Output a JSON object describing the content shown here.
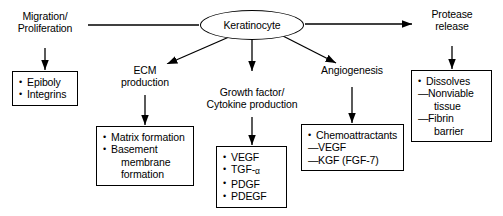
{
  "diagram": {
    "type": "flow-diagram",
    "stroke_color": "#000000",
    "background_color": "#ffffff",
    "center": {
      "label": "Keratinocyte",
      "shape": "ellipse"
    },
    "branches": [
      {
        "id": "migration",
        "label_lines": [
          "Migration/",
          "Proliferation"
        ],
        "arrow_from_center": "left",
        "box": {
          "items": [
            {
              "marker": "bullet",
              "text": "Epiboly"
            },
            {
              "marker": "bullet",
              "text": "Integrins"
            }
          ]
        }
      },
      {
        "id": "ecm",
        "label_lines": [
          "ECM",
          "production"
        ],
        "arrow_from_center": "diagonal-down-left",
        "box": {
          "items": [
            {
              "marker": "bullet",
              "text": "Matrix formation"
            },
            {
              "marker": "bullet",
              "text": "Basement"
            },
            {
              "marker": "cont",
              "text": "membrane"
            },
            {
              "marker": "cont",
              "text": "formation"
            }
          ]
        }
      },
      {
        "id": "growth-factor",
        "label_lines": [
          "Growth factor/",
          "Cytokine production"
        ],
        "arrow_from_center": "down",
        "box": {
          "items": [
            {
              "marker": "bullet",
              "text": "VEGF"
            },
            {
              "marker": "bullet",
              "text": "TGF-",
              "sub": "α"
            },
            {
              "marker": "bullet",
              "text": "PDGF"
            },
            {
              "marker": "bullet",
              "text": "PDEGF"
            }
          ]
        }
      },
      {
        "id": "angiogenesis",
        "label_lines": [
          "Angiogenesis"
        ],
        "arrow_from_center": "diagonal-down-right",
        "box": {
          "items": [
            {
              "marker": "bullet",
              "text": "Chemoattractants"
            },
            {
              "marker": "dash",
              "text": "VEGF"
            },
            {
              "marker": "dash",
              "text": "KGF (FGF-7)"
            }
          ]
        }
      },
      {
        "id": "protease",
        "label_lines": [
          "Protease",
          "release"
        ],
        "arrow_from_center": "right",
        "box": {
          "items": [
            {
              "marker": "bullet",
              "text": "Dissolves"
            },
            {
              "marker": "dash",
              "text": "Nonviable"
            },
            {
              "marker": "indent",
              "text": "tissue"
            },
            {
              "marker": "dash",
              "text": "Fibrin"
            },
            {
              "marker": "indent",
              "text": "barrier"
            }
          ]
        }
      }
    ]
  }
}
